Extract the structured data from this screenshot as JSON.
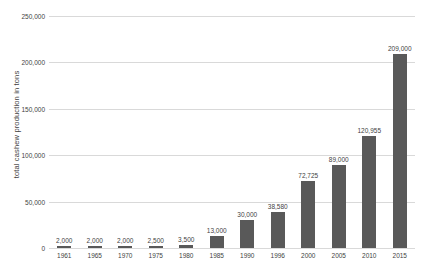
{
  "chart_data": {
    "type": "bar",
    "title": "",
    "xlabel": "",
    "ylabel": "total cashew production in tons",
    "categories": [
      "1961",
      "1965",
      "1970",
      "1975",
      "1980",
      "1985",
      "1990",
      "1996",
      "2000",
      "2005",
      "2010",
      "2015"
    ],
    "values": [
      2000,
      2000,
      2000,
      2500,
      3500,
      13000,
      30000,
      38580,
      72725,
      89000,
      120955,
      209000
    ],
    "value_labels": [
      "2,000",
      "2,000",
      "2,000",
      "2,500",
      "3,500",
      "13,000",
      "30,000",
      "38,580",
      "72,725",
      "89,000",
      "120,955",
      "209,000"
    ],
    "ylim": [
      0,
      250000
    ],
    "yticks": [
      0,
      50000,
      100000,
      150000,
      200000,
      250000
    ],
    "ytick_labels": [
      "0",
      "50,000",
      "100,000",
      "150,000",
      "200,000",
      "250,000"
    ],
    "grid": true,
    "legend": "none",
    "series_color": "#595959",
    "gridline_color": "#d9d9d9",
    "text_color": "#3f3f3f"
  }
}
